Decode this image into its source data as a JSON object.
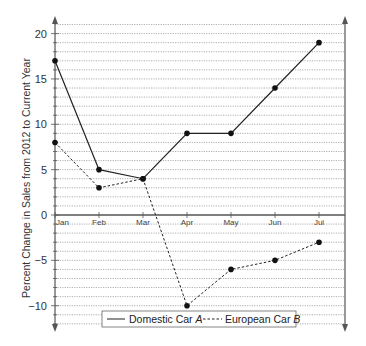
{
  "chart_data": {
    "type": "line",
    "title": "",
    "xlabel": "",
    "ylabel": "Percent Change in Sales from 2012 to Current Year",
    "categories": [
      "Jan",
      "Feb",
      "Mar",
      "Apr",
      "May",
      "Jun",
      "Jul"
    ],
    "series": [
      {
        "name": "Domestic Car A",
        "name_prefix": "Domestic Car ",
        "name_italic": "A",
        "style": "solid",
        "values": [
          17,
          5,
          4,
          9,
          9,
          14,
          19
        ]
      },
      {
        "name": "European Car B",
        "name_prefix": "European Car ",
        "name_italic": "B",
        "style": "dashed",
        "values": [
          8,
          3,
          4,
          -10,
          -6,
          -5,
          -3
        ]
      }
    ],
    "ylim": [
      -12,
      21
    ],
    "yticks": [
      20,
      15,
      10,
      5,
      0,
      -5,
      -10
    ],
    "ytick_labels": [
      "20",
      "15",
      "10",
      "5",
      "0",
      "−5",
      "−10"
    ],
    "grid": {
      "horizontal": true,
      "minor_step": 1,
      "style": "dotted"
    },
    "legend_position": "bottom-center"
  },
  "colors": {
    "line": "#222222",
    "grid": "#9a9a9a",
    "axis": "#555555",
    "text": "#333333"
  }
}
